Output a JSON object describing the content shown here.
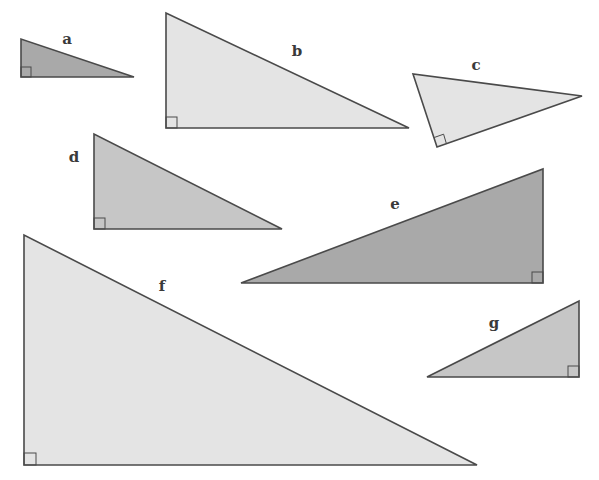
{
  "figure": {
    "colors": {
      "light": "#e4e4e4",
      "medium": "#c6c6c6",
      "dark": "#a9a9a9",
      "stroke": "#4a4a4a"
    },
    "triangles": [
      {
        "label": "a",
        "shade": "dark",
        "points": [
          [
            21,
            39
          ],
          [
            21,
            77
          ],
          [
            134,
            77
          ]
        ],
        "right_angle_vertex": [
          21,
          77
        ],
        "label_pos": [
          67,
          44
        ]
      },
      {
        "label": "b",
        "shade": "light",
        "points": [
          [
            166,
            13
          ],
          [
            166,
            128
          ],
          [
            409,
            128
          ]
        ],
        "right_angle_vertex": [
          166,
          128
        ],
        "label_pos": [
          297,
          56
        ]
      },
      {
        "label": "c",
        "shade": "light",
        "points": [
          [
            413,
            74
          ],
          [
            437,
            147
          ],
          [
            582,
            96
          ]
        ],
        "right_angle_vertex": [
          437,
          147
        ],
        "label_pos": [
          476,
          70
        ]
      },
      {
        "label": "d",
        "shade": "medium",
        "points": [
          [
            94,
            134
          ],
          [
            94,
            229
          ],
          [
            282,
            229
          ]
        ],
        "right_angle_vertex": [
          94,
          229
        ],
        "label_pos": [
          74,
          162
        ]
      },
      {
        "label": "e",
        "shade": "dark",
        "points": [
          [
            241,
            283
          ],
          [
            543,
            169
          ],
          [
            543,
            283
          ]
        ],
        "right_angle_vertex": [
          543,
          283
        ],
        "label_pos": [
          395,
          209
        ]
      },
      {
        "label": "f",
        "shade": "light",
        "points": [
          [
            24,
            235
          ],
          [
            24,
            465
          ],
          [
            477,
            465
          ]
        ],
        "right_angle_vertex": [
          24,
          465
        ],
        "label_pos": [
          162,
          291
        ]
      },
      {
        "label": "g",
        "shade": "medium",
        "points": [
          [
            427,
            377
          ],
          [
            579,
            301
          ],
          [
            579,
            377
          ]
        ],
        "right_angle_vertex": [
          579,
          377
        ],
        "label_pos": [
          494,
          328
        ]
      }
    ]
  }
}
